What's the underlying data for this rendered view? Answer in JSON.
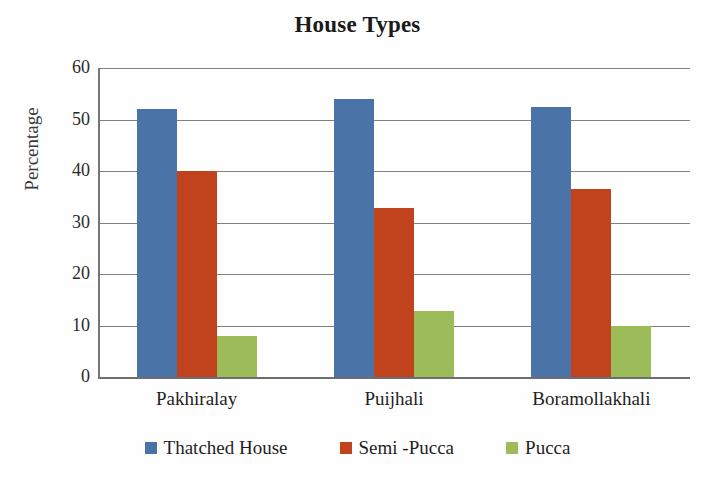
{
  "chart_data": {
    "type": "bar",
    "title": "House Types",
    "xlabel": "",
    "ylabel": "Percentage",
    "categories": [
      "Pakhiralay",
      "Puijhali",
      "Boramollakhali"
    ],
    "series": [
      {
        "name": "Thatched House",
        "color": "#4a74a8",
        "values": [
          52.0,
          54.0,
          52.5
        ]
      },
      {
        "name": "Semi -Pucca",
        "color": "#c0431e",
        "values": [
          40.0,
          32.8,
          36.5
        ]
      },
      {
        "name": "Pucca",
        "color": "#9cbb59",
        "values": [
          8.0,
          12.8,
          10.0
        ]
      }
    ],
    "ylim": [
      0,
      60
    ],
    "yticks": [
      0,
      10,
      20,
      30,
      40,
      50,
      60
    ],
    "ytick_labels": [
      "0",
      "10",
      "20",
      "30",
      "40",
      "50",
      "60"
    ],
    "grid": true,
    "legend_position": "bottom"
  }
}
